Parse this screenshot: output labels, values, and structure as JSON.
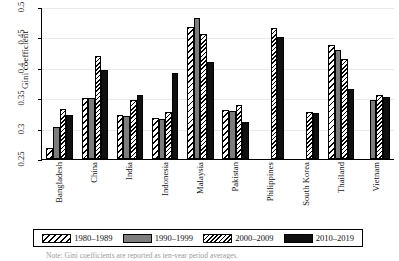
{
  "chart_data": {
    "type": "bar",
    "title": "",
    "xlabel": "",
    "ylabel": "Gini coefficient",
    "ylim": [
      0.25,
      0.5
    ],
    "yticks": [
      "0.25",
      "0.3",
      "0.35",
      "0.4",
      "0.45",
      "0.5"
    ],
    "ytick_values": [
      0.25,
      0.3,
      0.35,
      0.4,
      0.45,
      0.5
    ],
    "grid": true,
    "legend_position": "bottom",
    "categories": [
      "Bangladesh",
      "China",
      "India",
      "Indonesia",
      "Malaysia",
      "Pakistan",
      "Philippines",
      "South Korea",
      "Thailand",
      "Vietnam"
    ],
    "series": [
      {
        "name": "1980–1989",
        "pattern": "wide-diagonal-hatch",
        "color": "#ffffff",
        "values": [
          0.268,
          0.351,
          0.323,
          0.318,
          0.467,
          0.331,
          null,
          null,
          0.437,
          null
        ]
      },
      {
        "name": "1990–1999",
        "pattern": "solid-gray",
        "color": "#7d7d7d",
        "values": [
          0.302,
          0.351,
          0.32,
          0.316,
          0.482,
          0.329,
          null,
          null,
          0.429,
          0.347
        ]
      },
      {
        "name": "2000–2009",
        "pattern": "dense-diagonal-hatch",
        "color": "#ffffff",
        "values": [
          0.332,
          0.42,
          0.347,
          0.328,
          0.455,
          0.339,
          0.466,
          0.328,
          0.414,
          0.355
        ]
      },
      {
        "name": "2010–2019",
        "pattern": "solid-black",
        "color": "#101010",
        "values": [
          0.322,
          0.396,
          0.355,
          0.392,
          0.41,
          0.311,
          0.45,
          0.326,
          0.365,
          0.352
        ]
      }
    ]
  },
  "axis": {
    "y_title": "Gini coefficient",
    "y_tick_labels": [
      "0.25",
      "0.3",
      "0.35",
      "0.4",
      "0.45",
      "0.5"
    ]
  },
  "x_labels": [
    "Bangladesh",
    "China",
    "India",
    "Indonesia",
    "Malaysia",
    "Pakistan",
    "Philippines",
    "South Korea",
    "Thailand",
    "Vietnam"
  ],
  "legend": {
    "items": [
      {
        "label": "1980–1989",
        "pattern": "p1980"
      },
      {
        "label": "1990–1999",
        "pattern": "p1990"
      },
      {
        "label": "2000–2009",
        "pattern": "p2000"
      },
      {
        "label": "2010–2019",
        "pattern": "p2010"
      }
    ]
  },
  "caption": {
    "text": "Note: Gini coefficients are reported as ten-year period averages."
  }
}
